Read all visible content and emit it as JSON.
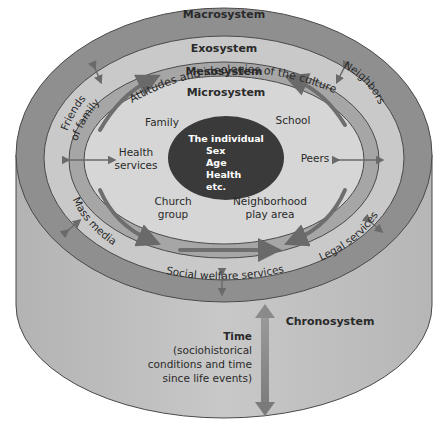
{
  "diagram": {
    "colors": {
      "background": "#ffffff",
      "cylinder_body": "#bdbdbd",
      "macro_ring": "#8f8f8f",
      "exo_ring": "#c9c9c9",
      "meso_ring": "#a6a6a6",
      "micro_area": "#d6d6d6",
      "individual": "#3a3a3a",
      "outline": "#4a4a4a",
      "text": "#2a2a2a",
      "time_arrow": "#8a8a8a"
    },
    "systems": {
      "macrosystem": {
        "label": "Macrosystem",
        "description": "Attitudes and ideologies of the culture"
      },
      "exosystem": {
        "label": "Exosystem",
        "items": [
          "Friends of family",
          "Neighbors",
          "Mass media",
          "Legal services",
          "Social welfare services"
        ],
        "friends_line1": "Friends",
        "friends_line2": "of family"
      },
      "mesosystem": {
        "label": "Mesosystem"
      },
      "microsystem": {
        "label": "Microsystem",
        "items": {
          "family": "Family",
          "school": "School",
          "health_line1": "Health",
          "health_line2": "services",
          "peers": "Peers",
          "church_line1": "Church",
          "church_line2": "group",
          "neighborhood_line1": "Neighborhood",
          "neighborhood_line2": "play area"
        }
      },
      "individual": {
        "title": "The individual",
        "attributes": [
          "Sex",
          "Age",
          "Health",
          "etc."
        ]
      },
      "chronosystem": {
        "label": "Chronosystem",
        "time_title": "Time",
        "time_lines": [
          "(sociohistorical",
          "conditions and time",
          "since life events)"
        ]
      }
    }
  }
}
